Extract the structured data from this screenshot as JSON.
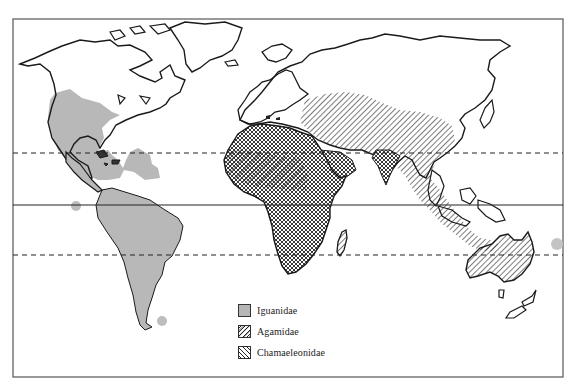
{
  "figure": {
    "type": "world-distribution-map",
    "reference_lines": [
      {
        "name": "tropic-of-cancer",
        "style": "dashed"
      },
      {
        "name": "equator",
        "style": "solid"
      },
      {
        "name": "tropic-of-capricorn",
        "style": "dashed"
      }
    ]
  },
  "legend": {
    "items": [
      {
        "label": "Iguanidae",
        "pattern": "solid-gray",
        "color": "#b5b5b5"
      },
      {
        "label": "Agamidae",
        "pattern": "diagonal-forward-hatch",
        "color": "#333333"
      },
      {
        "label": "Chamaeleonidae",
        "pattern": "diagonal-back-hatch",
        "color": "#333333"
      }
    ]
  },
  "colors": {
    "iguanidae_fill": "#b8b8b8",
    "outline": "#1a1a1a",
    "frame": "#555555",
    "background": "#ffffff"
  }
}
